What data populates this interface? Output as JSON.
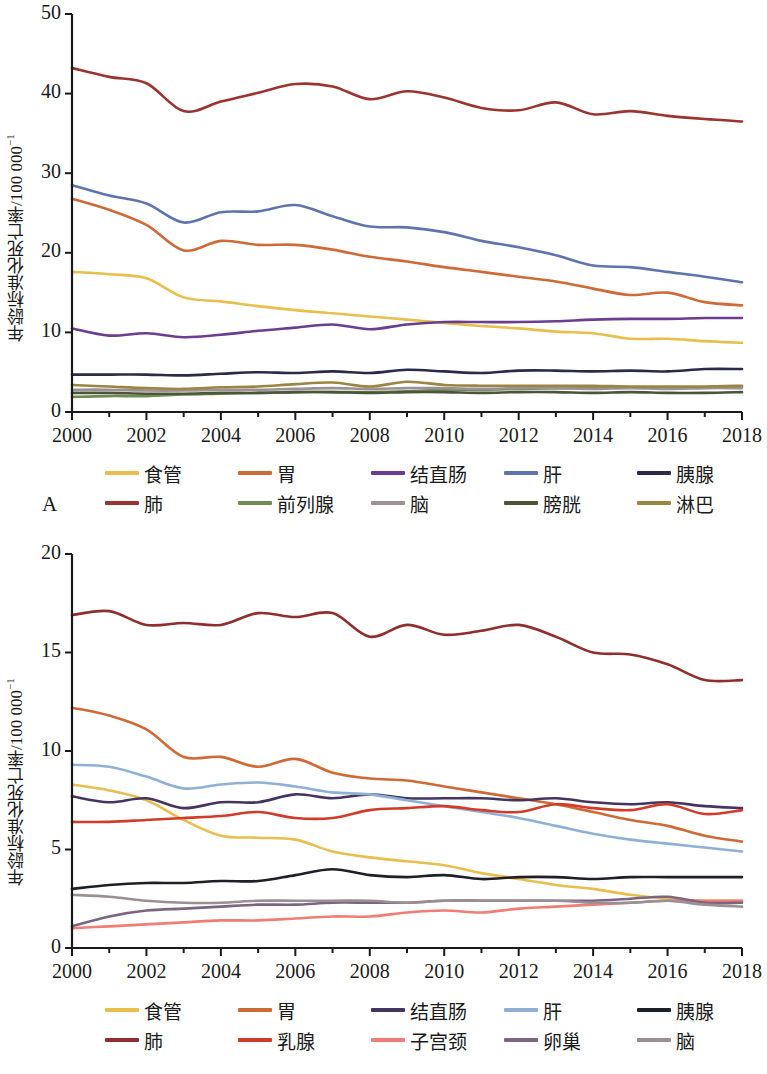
{
  "figure": {
    "panel_a_letter": "A",
    "panel_b_letter": "B",
    "axis_label_y": "年龄标准化死亡率/100 000",
    "axis_label_y_exponent": "−1"
  },
  "chart_data": [
    {
      "id": "panel-a",
      "type": "line",
      "title": "",
      "panel_label": "A",
      "xlabel": "",
      "ylabel": "年龄标准化死亡率/100 000−1",
      "x": [
        2000,
        2001,
        2002,
        2003,
        2004,
        2005,
        2006,
        2007,
        2008,
        2009,
        2010,
        2011,
        2012,
        2013,
        2014,
        2015,
        2016,
        2017,
        2018
      ],
      "xlim": [
        2000,
        2018
      ],
      "ylim": [
        0,
        50
      ],
      "xticks": [
        "2000",
        "2002",
        "2004",
        "2006",
        "2008",
        "2010",
        "2012",
        "2014",
        "2016",
        "2018"
      ],
      "yticks": [
        "0",
        "10",
        "20",
        "30",
        "40",
        "50"
      ],
      "grid": false,
      "legend_position": "below",
      "series": [
        {
          "name": "食管",
          "color": "#e8bf4d",
          "values": [
            17.6,
            17.3,
            16.8,
            14.4,
            13.9,
            13.3,
            12.8,
            12.4,
            12.0,
            11.6,
            11.2,
            10.8,
            10.5,
            10.1,
            9.9,
            9.2,
            9.2,
            8.9,
            8.7
          ]
        },
        {
          "name": "胃",
          "color": "#cf6a37",
          "values": [
            26.8,
            25.4,
            23.5,
            20.3,
            21.5,
            21.0,
            21.0,
            20.4,
            19.5,
            18.9,
            18.2,
            17.6,
            17.0,
            16.4,
            15.5,
            14.7,
            15.0,
            13.8,
            13.4
          ]
        },
        {
          "name": "结直肠",
          "color": "#6b3d8f",
          "values": [
            10.5,
            9.6,
            9.9,
            9.4,
            9.7,
            10.2,
            10.6,
            11.0,
            10.4,
            11.0,
            11.3,
            11.3,
            11.3,
            11.4,
            11.6,
            11.7,
            11.7,
            11.8,
            11.8
          ]
        },
        {
          "name": "肝",
          "color": "#5f74ae",
          "values": [
            28.5,
            27.2,
            26.2,
            23.8,
            25.1,
            25.2,
            26.0,
            24.6,
            23.3,
            23.2,
            22.6,
            21.5,
            20.7,
            19.7,
            18.4,
            18.2,
            17.6,
            17.0,
            16.3
          ]
        },
        {
          "name": "胰腺",
          "color": "#2a2a4a",
          "values": [
            4.7,
            4.7,
            4.7,
            4.6,
            4.8,
            5.0,
            4.9,
            5.1,
            4.9,
            5.3,
            5.1,
            4.9,
            5.2,
            5.2,
            5.1,
            5.2,
            5.1,
            5.4,
            5.4
          ]
        },
        {
          "name": "肺",
          "color": "#9b3430",
          "values": [
            43.2,
            42.1,
            41.3,
            37.8,
            39.0,
            40.1,
            41.2,
            40.9,
            39.3,
            40.3,
            39.5,
            38.2,
            37.9,
            38.9,
            37.4,
            37.8,
            37.2,
            36.8,
            36.5
          ]
        },
        {
          "name": "前列腺",
          "color": "#6f8b54",
          "values": [
            1.9,
            2.0,
            2.0,
            2.2,
            2.3,
            2.4,
            2.5,
            2.5,
            2.5,
            2.6,
            2.8,
            2.8,
            2.9,
            3.0,
            3.0,
            3.1,
            3.0,
            3.1,
            3.2
          ]
        },
        {
          "name": "脑",
          "color": "#9a9296",
          "values": [
            2.8,
            2.8,
            2.7,
            2.7,
            2.8,
            2.8,
            2.9,
            3.0,
            2.9,
            3.0,
            3.0,
            2.9,
            3.0,
            3.0,
            2.9,
            3.0,
            2.9,
            3.0,
            3.0
          ]
        },
        {
          "name": "膀胱",
          "color": "#4c5537",
          "values": [
            2.4,
            2.4,
            2.3,
            2.3,
            2.4,
            2.4,
            2.5,
            2.5,
            2.4,
            2.5,
            2.5,
            2.4,
            2.5,
            2.5,
            2.4,
            2.5,
            2.4,
            2.4,
            2.5
          ]
        },
        {
          "name": "淋巴",
          "color": "#9b8540",
          "values": [
            3.4,
            3.2,
            3.0,
            2.9,
            3.1,
            3.2,
            3.5,
            3.7,
            3.2,
            3.8,
            3.4,
            3.3,
            3.3,
            3.3,
            3.3,
            3.2,
            3.2,
            3.2,
            3.3
          ]
        }
      ]
    },
    {
      "id": "panel-b",
      "type": "line",
      "title": "",
      "panel_label": "B",
      "xlabel": "",
      "ylabel": "年龄标准化死亡率/100 000−1",
      "x": [
        2000,
        2001,
        2002,
        2003,
        2004,
        2005,
        2006,
        2007,
        2008,
        2009,
        2010,
        2011,
        2012,
        2013,
        2014,
        2015,
        2016,
        2017,
        2018
      ],
      "xlim": [
        2000,
        2018
      ],
      "ylim": [
        0,
        20
      ],
      "xticks": [
        "2000",
        "2002",
        "2004",
        "2006",
        "2008",
        "2010",
        "2012",
        "2014",
        "2016",
        "2018"
      ],
      "yticks": [
        "0",
        "5",
        "10",
        "15",
        "20"
      ],
      "grid": false,
      "legend_position": "below",
      "series": [
        {
          "name": "食管",
          "color": "#e8bf4d",
          "values": [
            8.3,
            8.0,
            7.5,
            6.5,
            5.7,
            5.6,
            5.5,
            4.9,
            4.6,
            4.4,
            4.2,
            3.8,
            3.5,
            3.2,
            3.0,
            2.7,
            2.5,
            2.4,
            2.4
          ]
        },
        {
          "name": "胃",
          "color": "#cf6a37",
          "values": [
            12.2,
            11.8,
            11.1,
            9.7,
            9.7,
            9.2,
            9.6,
            8.9,
            8.6,
            8.5,
            8.2,
            7.9,
            7.6,
            7.3,
            6.9,
            6.5,
            6.2,
            5.7,
            5.4
          ]
        },
        {
          "name": "结直肠",
          "color": "#433560",
          "values": [
            7.7,
            7.4,
            7.6,
            7.1,
            7.4,
            7.4,
            7.8,
            7.6,
            7.8,
            7.6,
            7.6,
            7.6,
            7.5,
            7.6,
            7.4,
            7.3,
            7.4,
            7.2,
            7.1
          ]
        },
        {
          "name": "肝",
          "color": "#8fb0d4",
          "values": [
            9.3,
            9.2,
            8.7,
            8.1,
            8.3,
            8.4,
            8.2,
            7.9,
            7.8,
            7.5,
            7.2,
            6.9,
            6.6,
            6.2,
            5.8,
            5.5,
            5.3,
            5.1,
            4.9
          ]
        },
        {
          "name": "胰腺",
          "color": "#1f1f28",
          "values": [
            3.0,
            3.2,
            3.3,
            3.3,
            3.4,
            3.4,
            3.7,
            4.0,
            3.7,
            3.6,
            3.7,
            3.5,
            3.6,
            3.6,
            3.5,
            3.6,
            3.6,
            3.6,
            3.6
          ]
        },
        {
          "name": "肺",
          "color": "#8e2f2d",
          "values": [
            16.9,
            17.1,
            16.4,
            16.5,
            16.4,
            17.0,
            16.8,
            17.0,
            15.8,
            16.4,
            15.9,
            16.1,
            16.4,
            15.8,
            15.0,
            14.9,
            14.4,
            13.6,
            13.6
          ]
        },
        {
          "name": "乳腺",
          "color": "#d13b29",
          "values": [
            6.4,
            6.4,
            6.5,
            6.6,
            6.7,
            6.9,
            6.6,
            6.6,
            7.0,
            7.1,
            7.2,
            7.0,
            6.9,
            7.3,
            7.1,
            7.0,
            7.3,
            6.8,
            7.0
          ]
        },
        {
          "name": "子宫颈",
          "color": "#ef7d74",
          "values": [
            1.0,
            1.1,
            1.2,
            1.3,
            1.4,
            1.4,
            1.5,
            1.6,
            1.6,
            1.8,
            1.9,
            1.8,
            2.0,
            2.1,
            2.2,
            2.3,
            2.4,
            2.4,
            2.4
          ]
        },
        {
          "name": "卵巢",
          "color": "#7c6580",
          "values": [
            1.1,
            1.6,
            1.9,
            2.0,
            2.1,
            2.2,
            2.2,
            2.3,
            2.3,
            2.3,
            2.4,
            2.4,
            2.4,
            2.4,
            2.4,
            2.5,
            2.6,
            2.3,
            2.3
          ]
        },
        {
          "name": "脑",
          "color": "#9a8f92",
          "values": [
            2.7,
            2.6,
            2.4,
            2.3,
            2.3,
            2.4,
            2.4,
            2.4,
            2.4,
            2.3,
            2.4,
            2.4,
            2.4,
            2.4,
            2.3,
            2.3,
            2.4,
            2.2,
            2.1
          ]
        }
      ]
    }
  ]
}
